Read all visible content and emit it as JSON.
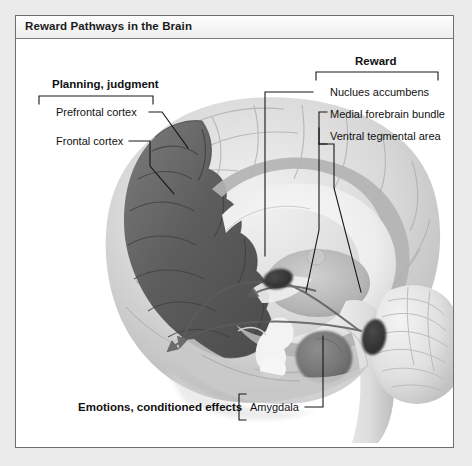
{
  "figure": {
    "title": "Reward Pathways in the Brain",
    "colors": {
      "frame_border": "#6f6f6f",
      "page_background": "#ebebeb",
      "panel_background": "#ffffff",
      "title_text": "#1b1b1b",
      "label_text": "#111111",
      "leader_line": "#1a1a1a",
      "brain_light": "#e4e4e4",
      "brain_mid": "#b9b9b9",
      "brain_shadow": "#8f8f8f",
      "cortex_dark": "#5e5e5e",
      "nucleus_dark": "#3d3d3d"
    }
  },
  "labels": {
    "planning_group": "Planning, judgment",
    "prefrontal_cortex": "Prefrontal cortex",
    "frontal_cortex": "Frontal cortex",
    "reward_group": "Reward",
    "nucleus_accumbens": "Nuclues accumbens",
    "medial_forebrain_bundle": "Medial forebrain bundle",
    "ventral_tegmental_area": "Ventral tegmental area",
    "emotions_group": "Emotions, conditioned effects",
    "amygdala": "Amygdala"
  },
  "structures": [
    {
      "name": "prefrontal-cortex",
      "shade": "cortex_dark",
      "side": "anterior-left"
    },
    {
      "name": "frontal-cortex",
      "shade": "cortex_dark",
      "side": "anterior-left"
    },
    {
      "name": "nucleus-accumbens",
      "shade": "nucleus_dark",
      "position": [
        262,
        240
      ]
    },
    {
      "name": "ventral-tegmental-area",
      "shade": "nucleus_dark",
      "position": [
        358,
        298
      ]
    },
    {
      "name": "amygdala",
      "shade": "brain_shadow",
      "position": [
        320,
        322
      ]
    },
    {
      "name": "corpus-callosum",
      "shade": "brain_light"
    },
    {
      "name": "cerebellum",
      "shade": "brain_light"
    },
    {
      "name": "brainstem",
      "shade": "brain_light"
    },
    {
      "name": "thalamus",
      "shade": "brain_mid"
    },
    {
      "name": "medial-forebrain-bundle-pathway",
      "shade": "brain_shadow"
    }
  ]
}
